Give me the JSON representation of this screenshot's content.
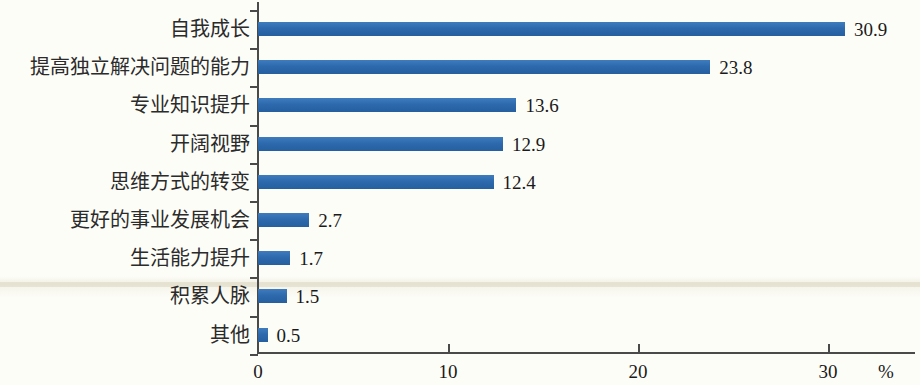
{
  "chart_data": {
    "type": "bar",
    "orientation": "horizontal",
    "title": "",
    "xlabel": "%",
    "ylabel": "",
    "xlim": [
      0,
      31.6
    ],
    "grid": false,
    "legend": null,
    "bar_color": "#2f6cb0",
    "categories": [
      "自我成长",
      "提高独立解决问题的能力",
      "专业知识提升",
      "开阔视野",
      "思维方式的转变",
      "更好的事业发展机会",
      "生活能力提升",
      "积累人脉",
      "其他"
    ],
    "values": [
      30.9,
      23.8,
      13.6,
      12.9,
      12.4,
      2.7,
      1.7,
      1.5,
      0.5
    ],
    "value_labels": [
      "30.9",
      "23.8",
      "13.6",
      "12.9",
      "12.4",
      "2.7",
      "1.7",
      "1.5",
      "0.5"
    ],
    "xticks": [
      0,
      10,
      20,
      30
    ],
    "xtick_labels": [
      "0",
      "10",
      "20",
      "30"
    ],
    "unit": "%"
  }
}
